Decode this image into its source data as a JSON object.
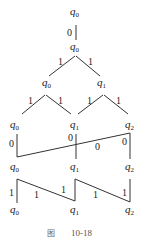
{
  "figure": {
    "caption_prefix": "图",
    "caption_number": "10-18"
  },
  "states": {
    "q0": {
      "base": "q",
      "sub": "0"
    },
    "q1": {
      "base": "q",
      "sub": "1"
    },
    "q2": {
      "base": "q",
      "sub": "2"
    }
  },
  "levels": [
    {
      "row": 1,
      "nodes": [
        "q0"
      ]
    },
    {
      "row": 2,
      "nodes": [
        "q0"
      ]
    },
    {
      "row": 3,
      "nodes": [
        "q0",
        "q1"
      ]
    },
    {
      "row": 4,
      "nodes": [
        "q0",
        "q1",
        "q2"
      ]
    },
    {
      "row": 5,
      "nodes": [
        "q0",
        "q1",
        "q2"
      ]
    },
    {
      "row": 6,
      "nodes": [
        "q0",
        "q1",
        "q2"
      ]
    }
  ],
  "edges": {
    "r1_r2": [
      "0"
    ],
    "r2_r3": [
      "1",
      "1"
    ],
    "r3_r4": [
      "1",
      "1",
      "1",
      "1"
    ],
    "r4_r5": [
      "0",
      "0",
      "0",
      "0"
    ],
    "r5_r6": [
      "1",
      "1",
      "1",
      "1",
      "1"
    ]
  }
}
